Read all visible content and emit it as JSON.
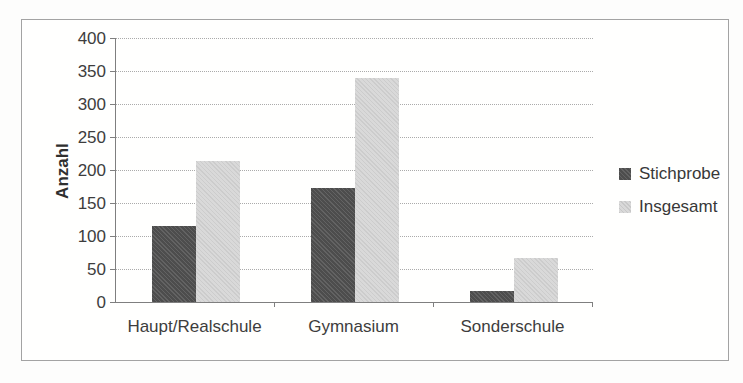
{
  "chart_data": {
    "type": "bar",
    "title": "",
    "xlabel": "",
    "ylabel": "Anzahl",
    "categories": [
      "Haupt/Realschule",
      "Gymnasium",
      "Sonderschule"
    ],
    "series": [
      {
        "name": "Stichprobe",
        "color": "#4d4d4d",
        "values": [
          115,
          172,
          17
        ]
      },
      {
        "name": "Insgesamt",
        "color": "#d9d9d9",
        "values": [
          213,
          340,
          67
        ]
      }
    ],
    "ylim": [
      0,
      400
    ],
    "yticks": [
      0,
      50,
      100,
      150,
      200,
      250,
      300,
      350,
      400
    ],
    "grid": true,
    "gridline_style": "dotted",
    "legend_position": "right"
  }
}
